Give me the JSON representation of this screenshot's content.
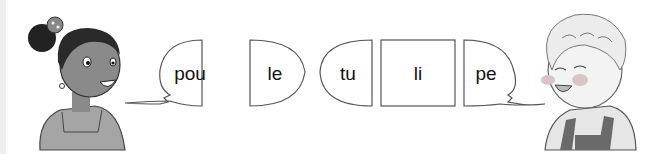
{
  "exercise": {
    "left_speaker": "girl",
    "right_speaker": "boy",
    "syllables": [
      "pou",
      "le",
      "tu",
      "li",
      "pe"
    ],
    "words": [
      {
        "syllables": [
          "pou",
          "le"
        ]
      },
      {
        "syllables": [
          "tu",
          "li",
          "pe"
        ]
      }
    ]
  },
  "colors": {
    "outline": "#555555",
    "skin_girl": "#8a8a8a",
    "hair": "#2a2a2a",
    "cheek": "#d8a0a0"
  }
}
